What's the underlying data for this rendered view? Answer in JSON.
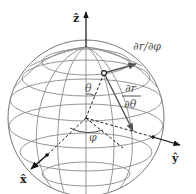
{
  "figure": {
    "colors": {
      "grid": "#8a8a8a",
      "outline": "#777777",
      "axis": "#111111",
      "tangent": "#555555",
      "background": "#ffffff"
    },
    "labels": {
      "z_axis": "ẑ",
      "x_axis": "x̂",
      "y_axis": "ŷ",
      "theta": "θ",
      "phi": "φ",
      "dr_dphi": "∂r/∂φ",
      "dr_dtheta_num": "∂r",
      "dr_dtheta_den": "∂θ"
    },
    "geometry": {
      "center": [
        86,
        118
      ],
      "radius": 78,
      "point_on_sphere": [
        104,
        73
      ],
      "north_pole": [
        86,
        47
      ]
    }
  }
}
